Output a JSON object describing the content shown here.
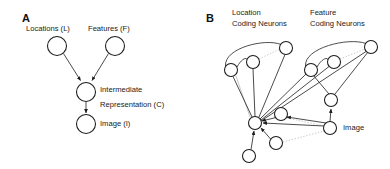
{
  "figure": {
    "width": 390,
    "height": 169,
    "background": "#ffffff",
    "ink": "#1a1a1a",
    "faint_ink": "#bdbdbd"
  },
  "panels": [
    {
      "id": "A",
      "letter": "A",
      "title": "Generative model",
      "nodes": [
        {
          "id": "L",
          "label": "Locations (L)",
          "cx": 57,
          "cy": 46,
          "r": 9.5,
          "label_x": 26,
          "label_y": 24
        },
        {
          "id": "F",
          "label": "Features (F)",
          "cx": 115,
          "cy": 46,
          "r": 9.5,
          "label_x": 88,
          "label_y": 24
        },
        {
          "id": "C",
          "label": "Intermediate Representation (C)",
          "cx": 86,
          "cy": 92,
          "r": 9.5,
          "label_x": 100,
          "label_y": 85
        },
        {
          "id": "I",
          "label": "Image (I)",
          "cx": 86,
          "cy": 124,
          "r": 9.5,
          "label_x": 100,
          "label_y": 119
        }
      ],
      "edges": [
        {
          "from": "L",
          "to": "C",
          "arrow": true
        },
        {
          "from": "F",
          "to": "C",
          "arrow": true
        },
        {
          "from": "C",
          "to": "I",
          "arrow": true
        }
      ],
      "labels": {
        "locations": "Locations (L)",
        "features": "Features (F)",
        "intermediate_line1": "Intermediate",
        "intermediate_line2": "Representation (C)",
        "image": "Image (I)"
      }
    },
    {
      "id": "B",
      "letter": "B",
      "title": "Neural implementation",
      "labels": {
        "location_line1": "Location",
        "location_line2": "Coding Neurons",
        "feature_line1": "Feature",
        "feature_line2": "Coding Neurons",
        "image": "Image"
      },
      "label_positions": {
        "location_x": 232,
        "location_y": 8,
        "feature_x": 310,
        "feature_y": 8,
        "image_x": 343,
        "image_y": 126
      },
      "nodes": [
        {
          "id": "L1",
          "group": "location",
          "cx": 231,
          "cy": 70,
          "r": 6.5
        },
        {
          "id": "L2",
          "group": "location",
          "cx": 253,
          "cy": 62,
          "r": 6.5
        },
        {
          "id": "L3",
          "group": "location",
          "cx": 286,
          "cy": 48,
          "r": 6.5
        },
        {
          "id": "F1",
          "group": "feature",
          "cx": 311,
          "cy": 70,
          "r": 6.5
        },
        {
          "id": "F2",
          "group": "feature",
          "cx": 334,
          "cy": 62,
          "r": 6.5
        },
        {
          "id": "F3",
          "group": "feature",
          "cx": 371,
          "cy": 47,
          "r": 6.5
        },
        {
          "id": "FC",
          "group": "feature",
          "cx": 331,
          "cy": 100,
          "r": 6.5
        },
        {
          "id": "HUB",
          "group": "intermediate",
          "cx": 255,
          "cy": 123,
          "r": 6.5
        },
        {
          "id": "C2",
          "group": "intermediate",
          "cx": 281,
          "cy": 114,
          "r": 6.5
        },
        {
          "id": "C3",
          "group": "intermediate",
          "cx": 276,
          "cy": 143,
          "r": 6.5
        },
        {
          "id": "C4",
          "group": "intermediate",
          "cx": 249,
          "cy": 156,
          "r": 6.5
        },
        {
          "id": "IMG",
          "group": "image",
          "cx": 330,
          "cy": 128,
          "r": 6.5
        }
      ],
      "edges": [
        {
          "from": "L1",
          "to": "HUB",
          "style": "solid"
        },
        {
          "from": "L2",
          "to": "HUB",
          "style": "solid"
        },
        {
          "from": "L3",
          "to": "HUB",
          "style": "solid"
        },
        {
          "from": "F1",
          "to": "HUB",
          "style": "solid"
        },
        {
          "from": "F2",
          "to": "HUB",
          "style": "solid"
        },
        {
          "from": "F3",
          "to": "HUB",
          "style": "solid"
        },
        {
          "from": "C2",
          "to": "HUB",
          "style": "solid",
          "arrow": true
        },
        {
          "from": "C3",
          "to": "HUB",
          "style": "solid",
          "arrow": true
        },
        {
          "from": "C4",
          "to": "HUB",
          "style": "solid",
          "arrow": true
        },
        {
          "from": "IMG",
          "to": "HUB",
          "style": "solid",
          "arrow": true
        },
        {
          "from": "IMG",
          "to": "FC",
          "style": "solid",
          "arrow": true
        },
        {
          "from": "IMG",
          "to": "C2",
          "style": "solid",
          "arrow": true
        },
        {
          "from": "FC",
          "to": "F1",
          "style": "solid"
        },
        {
          "from": "FC",
          "to": "F3",
          "style": "solid"
        },
        {
          "from": "L1",
          "to": "L3",
          "style": "curve"
        },
        {
          "from": "L1",
          "to": "L2",
          "style": "curve"
        },
        {
          "from": "F1",
          "to": "F3",
          "style": "curve"
        },
        {
          "from": "F1",
          "to": "F2",
          "style": "curve"
        },
        {
          "from": "L2",
          "to": "L3",
          "style": "dotted"
        },
        {
          "from": "F2",
          "to": "F3",
          "style": "dotted"
        },
        {
          "from": "C2",
          "to": "IMG",
          "style": "dotted"
        },
        {
          "from": "C3",
          "to": "IMG",
          "style": "dotted"
        }
      ]
    }
  ]
}
